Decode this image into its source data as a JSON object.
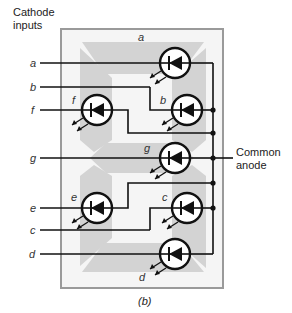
{
  "labels": {
    "cathode_inputs_line1": "Cathode",
    "cathode_inputs_line2": "inputs",
    "common_anode_line1": "Common",
    "common_anode_line2": "anode",
    "caption": "(b)"
  },
  "inputs": [
    "a",
    "b",
    "f",
    "g",
    "e",
    "c",
    "d"
  ],
  "segments": [
    {
      "id": "a",
      "label": "a"
    },
    {
      "id": "b",
      "label": "b"
    },
    {
      "id": "f",
      "label": "f"
    },
    {
      "id": "g",
      "label": "g"
    },
    {
      "id": "e",
      "label": "e"
    },
    {
      "id": "c",
      "label": "c"
    },
    {
      "id": "d",
      "label": "d"
    }
  ],
  "colors": {
    "wire": "#111111",
    "segment_pad": "#d3d3d3",
    "frame": "#9a9a9a",
    "frame_fill": "#f4f4f4"
  }
}
